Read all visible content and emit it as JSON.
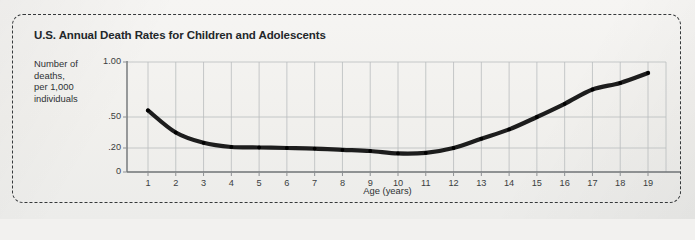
{
  "figure": {
    "title": "U.S. Annual Death Rates for Children and Adolescents",
    "y_axis_label_lines": [
      "Number of",
      "deaths,",
      "per 1,000",
      "individuals"
    ],
    "x_axis_title": "Age (years)",
    "border_style": "dashed-rounded",
    "colors": {
      "line": "#1d1d1d",
      "grid": "#b9bcbe",
      "axis": "#8d9093",
      "text": "#2e3134",
      "background": "#f2f1ef",
      "border": "#35383a"
    }
  },
  "chart_data": {
    "type": "line",
    "title": "U.S. Annual Death Rates for Children and Adolescents",
    "xlabel": "Age (years)",
    "ylabel": "Number of deaths, per 1,000 individuals",
    "grid": true,
    "legend": "none",
    "x": [
      1,
      2,
      3,
      4,
      5,
      6,
      7,
      8,
      9,
      10,
      11,
      12,
      13,
      14,
      15,
      16,
      17,
      18,
      19
    ],
    "xtick_labels": [
      "1",
      "2",
      "3",
      "4",
      "5",
      "6",
      "7",
      "8",
      "9",
      "10",
      "11",
      "12",
      "13",
      "14",
      "15",
      "16",
      "17",
      "18",
      "19"
    ],
    "xlim": [
      0.3,
      19.7
    ],
    "ytick_labels": [
      "1.00",
      ".50",
      ".20",
      "0"
    ],
    "ytick_values": [
      1.0,
      0.5,
      0.2,
      0
    ],
    "y_axis_scale": "nonlinear",
    "ylim": [
      0,
      1.0
    ],
    "series": [
      {
        "name": "Annual death rate",
        "values": [
          0.56,
          0.35,
          0.25,
          0.21,
          0.205,
          0.2,
          0.195,
          0.185,
          0.175,
          0.155,
          0.16,
          0.2,
          0.29,
          0.38,
          0.5,
          0.62,
          0.75,
          0.81,
          0.9
        ]
      }
    ]
  }
}
